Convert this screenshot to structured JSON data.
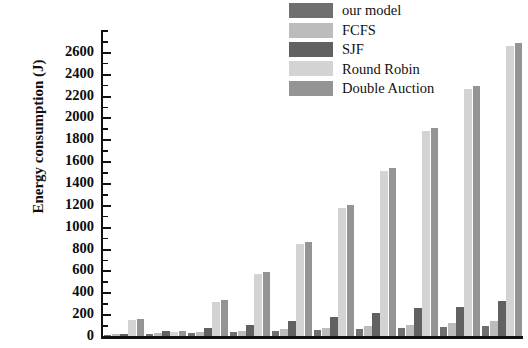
{
  "chart_data": {
    "type": "bar",
    "title": "",
    "xlabel": "",
    "ylabel": "Energy consumption (J)",
    "ylim": [
      0,
      2800
    ],
    "ytick_step": 200,
    "yticks": [
      0,
      200,
      400,
      600,
      800,
      1000,
      1200,
      1400,
      1600,
      1800,
      2000,
      2200,
      2400,
      2600
    ],
    "ytick_labels": [
      "0",
      "200",
      "400",
      "600",
      "800",
      "1000",
      "1200",
      "1400",
      "1600",
      "1800",
      "2000",
      "2200",
      "2400",
      "2600"
    ],
    "minor_ticks": true,
    "grid": false,
    "legend_position": "top-center",
    "categories": [
      "1",
      "2",
      "3",
      "4",
      "5",
      "6",
      "7",
      "8",
      "9",
      "10"
    ],
    "xtick_labels_visible": false,
    "series": [
      {
        "name": "our model",
        "color": "#6f6f6f",
        "values": [
          10,
          18,
          26,
          34,
          42,
          52,
          62,
          74,
          86,
          96
        ]
      },
      {
        "name": "FCFS",
        "color": "#bcbcbc",
        "values": [
          14,
          24,
          36,
          48,
          60,
          74,
          88,
          104,
          120,
          136
        ]
      },
      {
        "name": "SJF",
        "color": "#616161",
        "values": [
          20,
          45,
          70,
          100,
          140,
          175,
          215,
          255,
          270,
          320
        ]
      },
      {
        "name": "Round Robin",
        "color": "#d3d3d3",
        "values": [
          150,
          40,
          310,
          570,
          840,
          1170,
          1510,
          1880,
          2260,
          2650
        ]
      },
      {
        "name": "Double Auction",
        "color": "#949494",
        "values": [
          160,
          45,
          330,
          590,
          860,
          1195,
          1535,
          1905,
          2285,
          2680
        ]
      }
    ]
  },
  "legend": {
    "entries": [
      {
        "label": "our model"
      },
      {
        "label": "FCFS"
      },
      {
        "label": "SJF"
      },
      {
        "label": "Round Robin"
      },
      {
        "label": "Double Auction"
      }
    ]
  },
  "axis": {
    "y_title": "Energy consumption (J)"
  }
}
